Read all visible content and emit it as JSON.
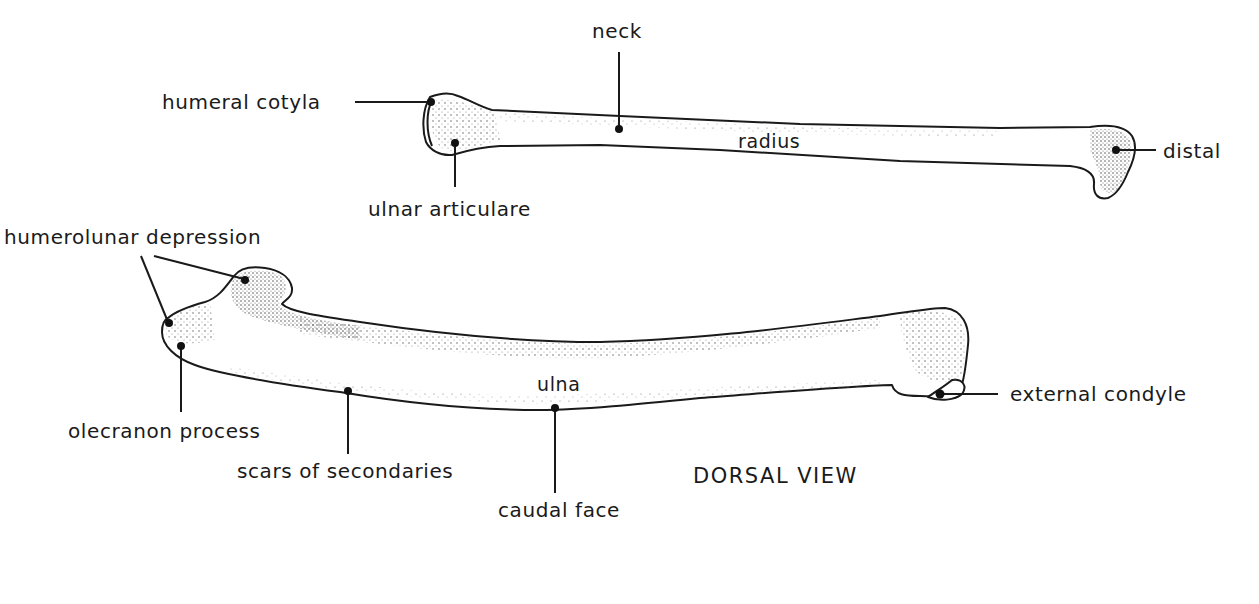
{
  "figure": {
    "view_title": "DORSAL VIEW",
    "colors": {
      "ink": "#1a1a1a",
      "background": "#ffffff",
      "stipple": "#555555"
    }
  },
  "radius": {
    "name": "radius",
    "labels": {
      "neck": "neck",
      "humeral_cotyla": "humeral cotyla",
      "ulnar_articulare": "ulnar articulare",
      "distal": "distal"
    }
  },
  "ulna": {
    "name": "ulna",
    "labels": {
      "humerolunar_depression": "humerolunar depression",
      "olecranon_process": "olecranon process",
      "scars_of_secondaries": "scars of secondaries",
      "caudal_face": "caudal face",
      "external_condyle": "external condyle"
    }
  }
}
